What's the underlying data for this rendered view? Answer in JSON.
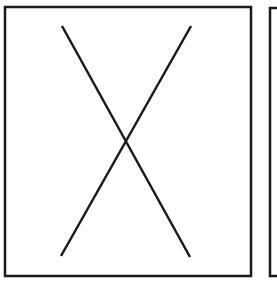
{
  "diagram": {
    "stroke_color": "#1a1a1a",
    "background": "#ffffff",
    "panels": [
      {
        "name": "panel-left",
        "x": 5,
        "y": 7,
        "width": 246,
        "height": 269,
        "content": "crossed-lines"
      },
      {
        "name": "panel-right",
        "x": 269,
        "y": 7,
        "width": 20,
        "height": 269,
        "content": "clipped"
      }
    ]
  }
}
